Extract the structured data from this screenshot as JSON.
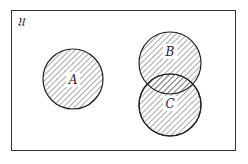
{
  "diagram": {
    "type": "venn",
    "universe_label": "𝔘",
    "sets": [
      {
        "label": "A",
        "cx": 73,
        "cy": 79,
        "r": 30
      },
      {
        "label": "B",
        "cx": 170,
        "cy": 63,
        "r": 31
      },
      {
        "label": "C",
        "cx": 170,
        "cy": 105,
        "r": 31
      }
    ],
    "colors": {
      "stroke": "#222222",
      "hatch": "#555555",
      "background": "#ffffff"
    }
  }
}
